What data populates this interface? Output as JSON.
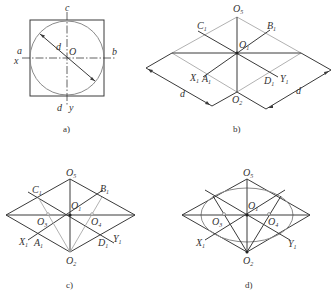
{
  "panels": {
    "a": {
      "caption": "a)",
      "labels": {
        "c": "c",
        "a": "a",
        "x": "x",
        "b": "b",
        "d_bottom": "d",
        "y": "y",
        "O": "O",
        "d_dim": "d"
      }
    },
    "b": {
      "caption": "b)",
      "labels": {
        "O5": "O",
        "O5_sub": "5",
        "C1": "C",
        "C1_sub": "1",
        "B1": "B",
        "B1_sub": "1",
        "O1": "O",
        "O1_sub": "1",
        "X1": "X",
        "X1_sub": "1",
        "A1": "A",
        "A1_sub": "1",
        "Y1": "Y",
        "Y1_sub": "1",
        "D1": "D",
        "D1_sub": "1",
        "O2": "O",
        "O2_sub": "2",
        "d_left": "d",
        "d_right": "d"
      }
    },
    "c": {
      "caption": "c)",
      "labels": {
        "O5": "O",
        "O5_sub": "5",
        "C1": "C",
        "C1_sub": "1",
        "B1": "B",
        "B1_sub": "1",
        "O1": "O",
        "O1_sub": "1",
        "O3": "O",
        "O3_sub": "3",
        "O4": "O",
        "O4_sub": "4",
        "X1": "X",
        "X1_sub": "1",
        "A1": "A",
        "A1_sub": "1",
        "D1": "D",
        "D1_sub": "1",
        "Y1": "Y",
        "Y1_sub": "1",
        "O2": "O",
        "O2_sub": "2"
      }
    },
    "d": {
      "caption": "d)",
      "labels": {
        "O5": "O",
        "O5_sub": "5",
        "O1": "O",
        "O1_sub": "1",
        "O3": "O",
        "O3_sub": "3",
        "O4": "O",
        "O4_sub": "4",
        "X1": "X",
        "X1_sub": "1",
        "Y1": "Y",
        "Y1_sub": "1",
        "O2": "O",
        "O2_sub": "2"
      }
    }
  }
}
